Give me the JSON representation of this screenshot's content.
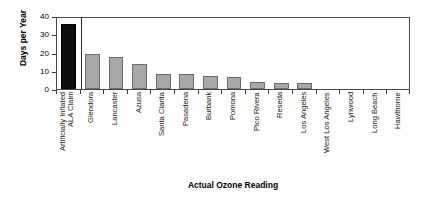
{
  "chart_data": {
    "type": "bar",
    "title": "",
    "subtitle": "",
    "xlabel": "Actual Ozone Reading",
    "ylabel": "Days per Year",
    "ylim": [
      0,
      40
    ],
    "yticks": [
      0,
      10,
      20,
      30,
      40
    ],
    "ytick_labels": [
      "0",
      "10",
      "20",
      "30",
      "40"
    ],
    "grid": false,
    "legend": null,
    "categories": [
      "Artificially Inflated ALA Claim",
      "Glendora",
      "Lancaster",
      "Azusa",
      "Santa Clarita",
      "Pasadena",
      "Burbank",
      "Pomona",
      "Pico Rivera",
      "Reseda",
      "Los Angeles",
      "West Los Angeles",
      "Lynwood",
      "Long Beach",
      "Hawthorne"
    ],
    "category_label_lines": [
      [
        "Artificially Inflated",
        "ALA Claim"
      ],
      [
        "Glendora"
      ],
      [
        "Lancaster"
      ],
      [
        "Azusa"
      ],
      [
        "Santa Clarita"
      ],
      [
        "Pasadena"
      ],
      [
        "Burbank"
      ],
      [
        "Pomona"
      ],
      [
        "Pico Rivera"
      ],
      [
        "Reseda"
      ],
      [
        "Los Angeles"
      ],
      [
        "West Los Angeles"
      ],
      [
        "Lynwood"
      ],
      [
        "Long Beach"
      ],
      [
        "Hawthorne"
      ]
    ],
    "values": [
      35.5,
      19,
      17.5,
      13.5,
      8.5,
      8.5,
      7,
      6.5,
      4,
      3.5,
      3.5,
      0,
      0,
      0,
      0
    ],
    "highlight_index": 0,
    "colors": {
      "bar": "#a8a8a8",
      "bar_edge": "#6d6d6d",
      "highlight_bar": "#0d0d0d",
      "highlight_bar_edge": "#000000",
      "axis": "#4a4a4a",
      "separator": "#2a2a2a",
      "text": "#000000",
      "background": "#ffffff"
    },
    "separator_after_index": 0
  }
}
